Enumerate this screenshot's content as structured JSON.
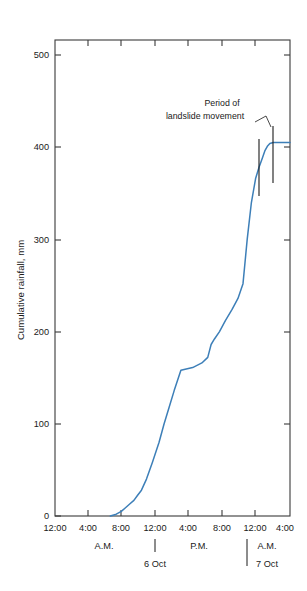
{
  "figure": {
    "background_color": "#ffffff",
    "line_color": "#3d7fb8",
    "axis_color": "#3a3a3a",
    "text_color": "#1a1a1a"
  },
  "axes": {
    "y_title": "Cumulative rainfall, mm",
    "y_ticks": [
      "0",
      "100",
      "200",
      "300",
      "400",
      "500"
    ],
    "x_ticks": [
      "12:00",
      "4:00",
      "8:00",
      "12:00",
      "4:00",
      "8:00",
      "12:00",
      "4:00"
    ],
    "x_period_labels": [
      "A.M.",
      "P.M.",
      "A.M."
    ],
    "x_day_labels": [
      "6 Oct",
      "7 Oct"
    ]
  },
  "annotations": {
    "period_line1": "Period of",
    "period_line2": "landslide movement"
  },
  "chart_data": {
    "type": "line",
    "title": "",
    "xlabel": "",
    "ylabel": "Cumulative rainfall, mm",
    "xlim": [
      0,
      28
    ],
    "ylim": [
      0,
      530
    ],
    "ytick_values": [
      0,
      100,
      200,
      300,
      400,
      500
    ],
    "xtick_values": [
      0,
      4,
      8,
      12,
      16,
      20,
      24,
      28
    ],
    "xtick_labels": [
      "12:00",
      "4:00",
      "8:00",
      "12:00",
      "4:00",
      "8:00",
      "12:00",
      "4:00"
    ],
    "x_units": "hours from 12:00 A.M. on 6 Oct",
    "grid": false,
    "legend": false,
    "series": [
      {
        "name": "Cumulative rainfall",
        "color": "#3d7fb8",
        "x": [
          6.6,
          7.3,
          7.9,
          8.4,
          8.9,
          9.4,
          9.8,
          10.3,
          10.9,
          11.6,
          12.4,
          13.0,
          13.6,
          14.2,
          15.0,
          16.4,
          17.5,
          18.2,
          18.6,
          19.0,
          19.6,
          20.3,
          21.1,
          21.8,
          22.4,
          22.9,
          23.4,
          23.9,
          24.3,
          24.7,
          25.0,
          25.3,
          25.6,
          26.0,
          26.6,
          27.4,
          28.0
        ],
        "y": [
          0,
          2,
          5,
          9,
          13,
          17,
          22,
          28,
          40,
          58,
          80,
          100,
          118,
          136,
          158,
          161,
          166,
          172,
          186,
          192,
          200,
          212,
          224,
          236,
          252,
          300,
          340,
          366,
          378,
          388,
          396,
          401,
          404,
          405,
          405,
          405,
          405
        ]
      }
    ],
    "annotations": [
      {
        "text": "Period of landslide movement",
        "type": "interval-marker",
        "x_start": 24.3,
        "x_end": 25.9,
        "y_range": [
          370,
          420
        ]
      }
    ]
  }
}
